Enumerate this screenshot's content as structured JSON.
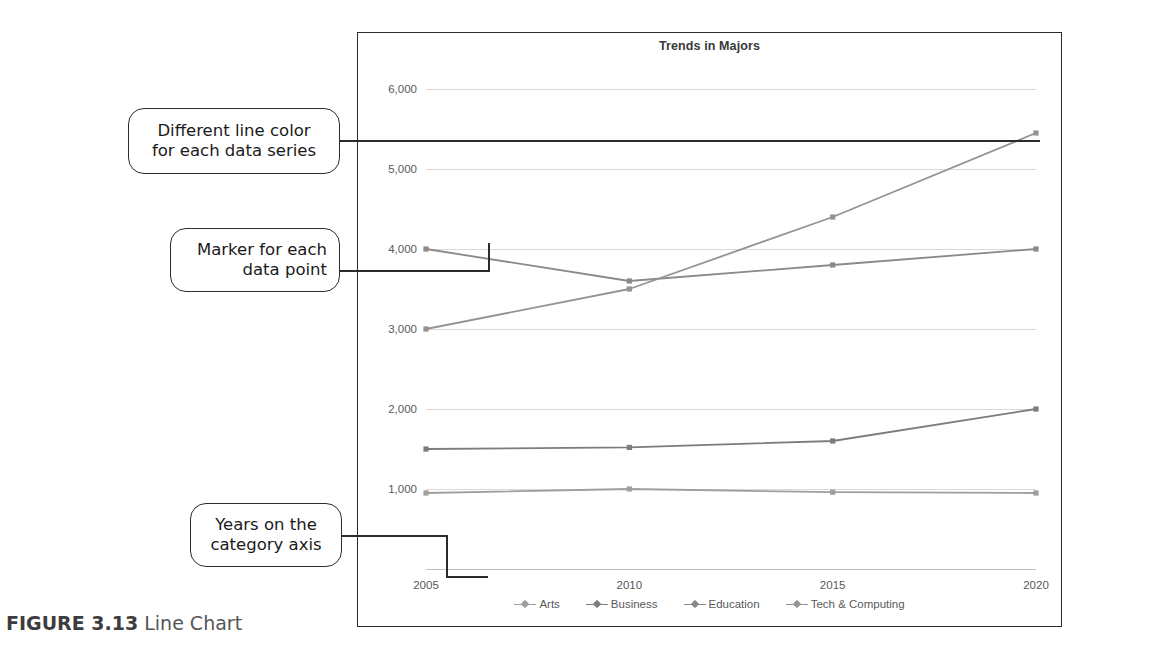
{
  "figure": {
    "label": "FIGURE 3.13",
    "text": "Line Chart"
  },
  "chart_data": {
    "type": "line",
    "title": "Trends in Majors",
    "xlabel": "",
    "ylabel": "",
    "categories": [
      "2005",
      "2010",
      "2015",
      "2020"
    ],
    "ylim": [
      0,
      6000
    ],
    "yticks": [
      "1,000",
      "2,000",
      "3,000",
      "4,000",
      "5,000",
      "6,000"
    ],
    "ytick_values": [
      1000,
      2000,
      3000,
      4000,
      5000,
      6000
    ],
    "grid": true,
    "legend_position": "bottom",
    "series": [
      {
        "name": "Arts",
        "values": [
          950,
          1000,
          960,
          950
        ],
        "color": "#9e9e9e"
      },
      {
        "name": "Business",
        "values": [
          1500,
          1520,
          1600,
          2000
        ],
        "color": "#7c7c7c"
      },
      {
        "name": "Education",
        "values": [
          4000,
          3600,
          3800,
          4000
        ],
        "color": "#8a8a8a"
      },
      {
        "name": "Tech & Computing",
        "values": [
          3000,
          3500,
          4400,
          5450
        ],
        "color": "#949494"
      }
    ]
  },
  "callouts": [
    {
      "id": "line-color",
      "line1": "Different line color",
      "line2": "for each data series"
    },
    {
      "id": "marker",
      "line1": "Marker for each",
      "line2": "data point"
    },
    {
      "id": "years",
      "line1": "Years on the",
      "line2": "category axis"
    }
  ]
}
